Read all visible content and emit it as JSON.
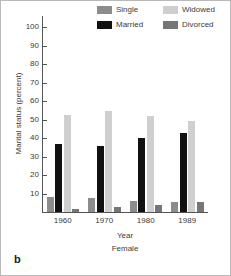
{
  "panel_label": "b",
  "chart_data": {
    "type": "bar",
    "title": "",
    "subtitle": "Female",
    "xlabel": "Year",
    "ylabel": "Marital status (percent)",
    "categories": [
      "1960",
      "1970",
      "1980",
      "1989"
    ],
    "ylim": [
      0,
      105
    ],
    "yticks": [
      10,
      20,
      30,
      40,
      50,
      60,
      70,
      80,
      90,
      100
    ],
    "ytick_labels": [
      "10",
      "20",
      "30",
      "40",
      "50",
      "60",
      "70",
      "80",
      "90",
      "100"
    ],
    "grid": false,
    "legend_position": "top-right",
    "series": [
      {
        "name": "Single",
        "color": "#8c8c8c",
        "values": [
          8.0,
          7.5,
          6.0,
          5.5
        ]
      },
      {
        "name": "Married",
        "color": "#111111",
        "values": [
          37.0,
          36.0,
          40.0,
          42.5
        ]
      },
      {
        "name": "Widowed",
        "color": "#cfcfcf",
        "values": [
          52.5,
          54.5,
          52.0,
          49.5
        ]
      },
      {
        "name": "Divorced",
        "color": "#767676",
        "values": [
          1.5,
          2.5,
          4.0,
          5.5
        ]
      }
    ]
  }
}
